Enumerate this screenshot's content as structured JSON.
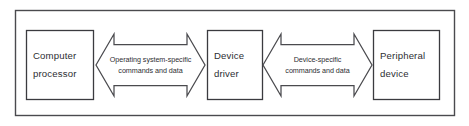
{
  "diagram": {
    "type": "block-flow",
    "border": {
      "name": "outer-border",
      "color": "#4a4a4e"
    },
    "background_color": "#ffffff",
    "text_color": "#2e2e33",
    "nodes": [
      {
        "id": "computer-processor",
        "label_line1": "Computer",
        "label_line2": "processor",
        "shape": "rectangle"
      },
      {
        "id": "device-driver",
        "label_line1": "Device",
        "label_line2": "driver",
        "shape": "rectangle"
      },
      {
        "id": "peripheral-device",
        "label_line1": "Peripheral",
        "label_line2": "device",
        "shape": "rectangle"
      }
    ],
    "connectors": [
      {
        "id": "processor-to-driver",
        "from": "computer-processor",
        "to": "device-driver",
        "direction": "bidirectional",
        "shape": "double-headed-arrow",
        "label_line1": "Operating system-specific",
        "label_line2": "commands and data"
      },
      {
        "id": "driver-to-peripheral",
        "from": "device-driver",
        "to": "peripheral-device",
        "direction": "bidirectional",
        "shape": "double-headed-arrow",
        "label_line1": "Device-specific",
        "label_line2": "commands and data"
      }
    ]
  }
}
